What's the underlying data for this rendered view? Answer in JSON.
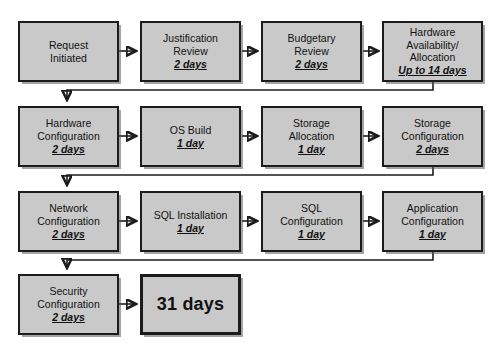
{
  "diagram": {
    "background_color": "#ffffff",
    "node_fill_color": "#c9c9c9",
    "node_border_color": "#1c1c1c",
    "total_label": "31 days",
    "rows": [
      {
        "nodes": [
          {
            "name": "request-initiated",
            "lines": [
              "Request",
              "Initiated"
            ],
            "duration": ""
          },
          {
            "name": "justification-review",
            "lines": [
              "Justification",
              "Review"
            ],
            "duration": "2 days"
          },
          {
            "name": "budgetary-review",
            "lines": [
              "Budgetary",
              "Review"
            ],
            "duration": "2 days"
          },
          {
            "name": "hardware-availability-allocation",
            "lines": [
              "Hardware",
              "Availability/",
              "Allocation"
            ],
            "duration": "Up to 14 days"
          }
        ]
      },
      {
        "nodes": [
          {
            "name": "hardware-configuration",
            "lines": [
              "Hardware",
              "Configuration"
            ],
            "duration": "2 days"
          },
          {
            "name": "os-build",
            "lines": [
              "OS Build"
            ],
            "duration": "1 day"
          },
          {
            "name": "storage-allocation",
            "lines": [
              "Storage",
              "Allocation"
            ],
            "duration": "1 day"
          },
          {
            "name": "storage-configuration",
            "lines": [
              "Storage",
              "Configuration"
            ],
            "duration": "2 days"
          }
        ]
      },
      {
        "nodes": [
          {
            "name": "network-configuration",
            "lines": [
              "Network",
              "Configuration"
            ],
            "duration": "2 days"
          },
          {
            "name": "sql-installation",
            "lines": [
              "SQL Installation"
            ],
            "duration": "1 day"
          },
          {
            "name": "sql-configuration",
            "lines": [
              "SQL",
              "Configuration"
            ],
            "duration": "1 day"
          },
          {
            "name": "application-configuration",
            "lines": [
              "Application",
              "Configuration"
            ],
            "duration": "1 day"
          }
        ]
      },
      {
        "nodes": [
          {
            "name": "security-configuration",
            "lines": [
              "Security",
              "Configuration"
            ],
            "duration": "2 days"
          },
          {
            "name": "total-duration",
            "lines": [],
            "duration": "",
            "total": "31 days"
          }
        ]
      }
    ]
  }
}
